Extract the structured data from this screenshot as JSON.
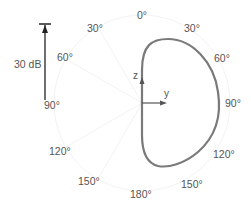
{
  "diagram": {
    "type": "polar radiation pattern",
    "scale": {
      "label": "30 dB"
    },
    "angle_labels": {
      "top": "0°",
      "right_30": "30°",
      "right_60": "60°",
      "right_90": "90°",
      "right_120": "120°",
      "right_150": "150°",
      "bottom": "180°",
      "left_30": "30°",
      "left_60": "60°",
      "left_90": "90°",
      "left_120": "120°",
      "left_150": "150°"
    },
    "axes": {
      "z": "z",
      "y": "y"
    },
    "colors": {
      "curve": "#7a7a7a",
      "axis": "#555555",
      "text": "#555555",
      "grid": "#f2f2f2"
    }
  }
}
